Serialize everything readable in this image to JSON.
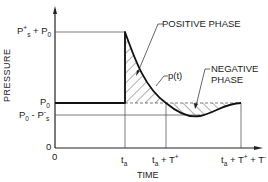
{
  "diagram": {
    "y_axis_label": "PRESSURE",
    "x_axis_label": "TIME",
    "y_ticks": [
      {
        "label_main": "P",
        "label_sup": "+",
        "label_sub": "s",
        "label_rest": " + P",
        "label_rest_sub": "0",
        "name": "peak"
      },
      {
        "label_main": "P",
        "label_sub": "0",
        "name": "ambient"
      },
      {
        "label_main": "P",
        "label_sub": "0",
        "label_rest": " - P",
        "label_rest_sub": "s",
        "label_rest_sup": "-",
        "name": "negative-peak"
      },
      {
        "label_main": "0",
        "name": "zero"
      }
    ],
    "x_ticks": [
      {
        "label": "0"
      },
      {
        "label_main": "t",
        "label_sub": "a"
      },
      {
        "label_main": "t",
        "label_sub": "a",
        "label_rest": " + T",
        "label_rest_sup": "+"
      },
      {
        "label_main": "t",
        "label_sub": "a",
        "label_rest": " + T",
        "label_rest_sup": "+",
        "label_rest2": " + T",
        "label_rest2_sup": "-"
      }
    ],
    "annotations": {
      "positive_phase": "POSITIVE PHASE",
      "negative_phase_line1": "NEGATIVE",
      "negative_phase_line2": "PHASE",
      "curve": "p(t)"
    },
    "colors": {
      "line": "#222222",
      "hatch": "#333333",
      "background": "#ffffff"
    }
  }
}
